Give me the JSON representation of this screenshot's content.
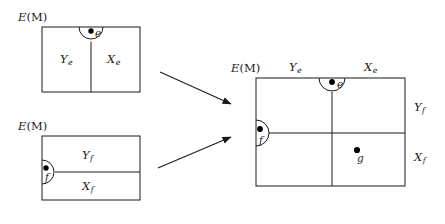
{
  "figure": {
    "type": "mathematical-diagram",
    "background_color": "#ffffff",
    "stroke_color": "#1a1a1a",
    "point_color": "#000000"
  },
  "panels": {
    "top_left": {
      "name": "top-left-complex",
      "ambient_label": "E(M)",
      "ambient_label_base": "E",
      "ambient_label_paren": "(M)",
      "box": {
        "x": 42,
        "y": 27,
        "width": 98,
        "height": 65
      },
      "divider": {
        "orientation": "vertical",
        "x": 91,
        "y1": 40,
        "y2": 92
      },
      "regions": [
        {
          "name": "region-Ye",
          "base": "Y",
          "sub": "e",
          "x": 66,
          "y": 60
        },
        {
          "name": "region-Xe",
          "base": "X",
          "sub": "e",
          "x": 113,
          "y": 60
        }
      ],
      "marked_point": {
        "name": "point-e",
        "label": "e",
        "cx": 91,
        "cy": 30,
        "radius": 2.6,
        "arc_radius": 12,
        "label_x": 95,
        "label_y": 34
      }
    },
    "bottom_left": {
      "name": "bottom-left-complex",
      "ambient_label": "E(M)",
      "ambient_label_base": "E",
      "ambient_label_paren": "(M)",
      "box": {
        "x": 42,
        "y": 136,
        "width": 98,
        "height": 64
      },
      "divider": {
        "orientation": "horizontal",
        "y": 172,
        "x1": 56,
        "x2": 140
      },
      "regions": [
        {
          "name": "region-Yf",
          "base": "Y",
          "sub": "f",
          "x": 88,
          "y": 158
        },
        {
          "name": "region-Xf",
          "base": "X",
          "sub": "f",
          "x": 88,
          "y": 190
        }
      ],
      "marked_point": {
        "name": "point-f",
        "label": "f",
        "cx": 45,
        "cy": 168,
        "radius": 2.6,
        "arc_radius": 12,
        "label_x": 46,
        "label_y": 182
      }
    },
    "right": {
      "name": "composite-complex",
      "ambient_label": "E(M)",
      "ambient_label_base": "E",
      "ambient_label_paren": "(M)",
      "box": {
        "x": 256,
        "y": 78,
        "width": 149,
        "height": 108
      },
      "dividers": [
        {
          "name": "vertical-divider",
          "orientation": "vertical",
          "x": 332,
          "y1": 92,
          "y2": 186
        },
        {
          "name": "horizontal-divider",
          "orientation": "horizontal",
          "y": 133,
          "x1": 269,
          "x2": 405
        }
      ],
      "top_labels": [
        {
          "name": "label-Ye",
          "base": "Y",
          "sub": "e",
          "x": 294,
          "y": 70
        },
        {
          "name": "label-Xe",
          "base": "X",
          "sub": "e",
          "x": 370,
          "y": 70
        }
      ],
      "side_labels": [
        {
          "name": "label-Yf",
          "base": "Y",
          "sub": "f",
          "x": 417,
          "y": 110
        },
        {
          "name": "label-Xf",
          "base": "X",
          "sub": "f",
          "x": 417,
          "y": 160
        }
      ],
      "marked_points": [
        {
          "name": "point-e",
          "label": "e",
          "cx": 332,
          "cy": 81,
          "radius": 2.8,
          "arc_radius": 13,
          "label_x": 337,
          "label_y": 86
        },
        {
          "name": "point-f",
          "label": "f",
          "cx": 259,
          "cy": 131,
          "radius": 2.8,
          "arc_radius": 13,
          "label_x": 260,
          "label_y": 146
        },
        {
          "name": "point-g",
          "label": "g",
          "cx": 357,
          "cy": 150,
          "radius": 3.0,
          "label_x": 359,
          "label_y": 162
        }
      ]
    }
  },
  "arrows": [
    {
      "name": "arrow-from-top-left",
      "x1": 160,
      "y1": 72,
      "x2": 233,
      "y2": 105,
      "direction": "down-right"
    },
    {
      "name": "arrow-from-bottom-left",
      "x1": 158,
      "y1": 168,
      "x2": 233,
      "y2": 136,
      "direction": "up-right"
    }
  ],
  "ambient_labels": {
    "top_left": {
      "x": 18,
      "y": 18
    },
    "bottom_left": {
      "x": 18,
      "y": 128
    },
    "right": {
      "x": 231,
      "y": 70
    }
  }
}
